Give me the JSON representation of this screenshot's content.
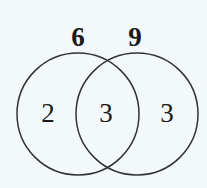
{
  "diagram": {
    "type": "venn",
    "sets": [
      {
        "id": "A",
        "total_label": "6",
        "region_only_label": "2"
      },
      {
        "id": "B",
        "total_label": "9",
        "region_only_label": "3"
      }
    ],
    "intersection_label": "3",
    "colors": {
      "background": "#f3f9fa",
      "stroke": "#333333",
      "text": "#1a1a1a"
    }
  }
}
